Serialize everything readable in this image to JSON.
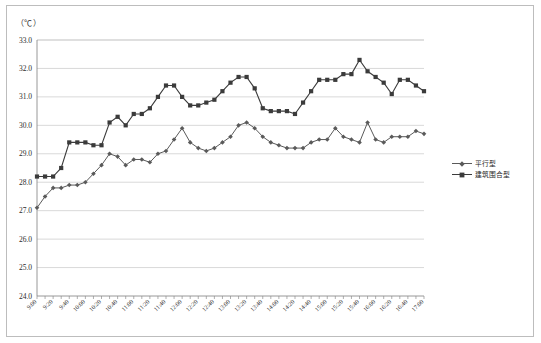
{
  "chart_data": {
    "type": "line",
    "title": "",
    "subtitle": "",
    "unit_label": "（℃）",
    "xlabel": "",
    "ylabel": "",
    "ylim": [
      24.0,
      33.0
    ],
    "ytick_step": 1.0,
    "ytick_labels": [
      "33.0",
      "32.0",
      "31.0",
      "30.0",
      "29.0",
      "28.0",
      "27.0",
      "26.0",
      "25.0",
      "24.0"
    ],
    "grid": true,
    "legend_position": "right",
    "x": [
      "9:00",
      "9:10",
      "9:20",
      "9:30",
      "9:40",
      "9:50",
      "10:00",
      "10:10",
      "10:20",
      "10:30",
      "10:40",
      "10:50",
      "11:00",
      "11:10",
      "11:20",
      "11:30",
      "11:40",
      "11:50",
      "12:00",
      "12:10",
      "12:20",
      "12:30",
      "12:40",
      "12:50",
      "13:00",
      "13:10",
      "13:20",
      "13:30",
      "13:40",
      "13:50",
      "14:00",
      "14:10",
      "14:20",
      "14:30",
      "14:40",
      "14:50",
      "15:00",
      "15:10",
      "15:20",
      "15:30",
      "15:40",
      "15:50",
      "16:00",
      "16:10",
      "16:20",
      "16:30",
      "16:40",
      "16:50",
      "17:00"
    ],
    "xtick_labels": [
      "9:00",
      "9:20",
      "9:40",
      "10:00",
      "10:20",
      "10:40",
      "11:00",
      "11:20",
      "11:40",
      "12:00",
      "12:20",
      "12:40",
      "13:00",
      "13:20",
      "13:40",
      "14:00",
      "14:20",
      "14:40",
      "15:00",
      "15:20",
      "15:40",
      "16:00",
      "16:20",
      "16:40",
      "17:00"
    ],
    "xtick_label_interval": 2,
    "series": [
      {
        "name": "平行型",
        "color": "#5a5a5a",
        "marker": "diamond",
        "values": [
          27.1,
          27.5,
          27.8,
          27.8,
          27.9,
          27.9,
          28.0,
          28.3,
          28.6,
          29.0,
          28.9,
          28.6,
          28.8,
          28.8,
          28.7,
          29.0,
          29.1,
          29.5,
          29.9,
          29.4,
          29.2,
          29.1,
          29.2,
          29.4,
          29.6,
          30.0,
          30.1,
          29.9,
          29.6,
          29.4,
          29.3,
          29.2,
          29.2,
          29.2,
          29.4,
          29.5,
          29.5,
          29.9,
          29.6,
          29.5,
          29.4,
          30.1,
          29.5,
          29.4,
          29.6,
          29.6,
          29.6,
          29.8,
          29.7
        ]
      },
      {
        "name": "建筑围合型",
        "color": "#3b3b3b",
        "marker": "square",
        "values": [
          28.2,
          28.2,
          28.2,
          28.5,
          29.4,
          29.4,
          29.4,
          29.3,
          29.3,
          30.1,
          30.3,
          30.0,
          30.4,
          30.4,
          30.6,
          31.0,
          31.4,
          31.4,
          31.0,
          30.7,
          30.7,
          30.8,
          30.9,
          31.2,
          31.5,
          31.7,
          31.7,
          31.3,
          30.6,
          30.5,
          30.5,
          30.5,
          30.4,
          30.8,
          31.2,
          31.6,
          31.6,
          31.6,
          31.8,
          31.8,
          32.3,
          31.9,
          31.7,
          31.5,
          31.1,
          31.6,
          31.6,
          31.4,
          31.2
        ]
      }
    ]
  },
  "legend": {
    "items": [
      {
        "label": "平行型",
        "color": "#5a5a5a",
        "marker": "diamond"
      },
      {
        "label": "建筑围合型",
        "color": "#3b3b3b",
        "marker": "square"
      }
    ]
  }
}
